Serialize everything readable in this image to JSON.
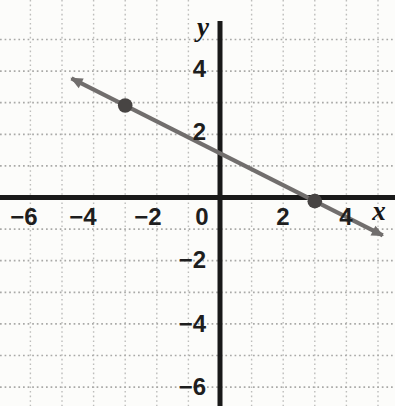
{
  "chart_data": {
    "type": "line",
    "title": "",
    "xlabel": "x",
    "ylabel": "y",
    "xlim": [
      -7,
      5.5
    ],
    "ylim": [
      -6.6,
      6.2
    ],
    "grid": {
      "style": "dotted",
      "spacing": 1,
      "x_range": [
        -6,
        5
      ],
      "y_range": [
        -6,
        5
      ]
    },
    "x_ticks": {
      "values": [
        -6,
        -4,
        -2,
        0,
        2,
        4
      ],
      "labels": [
        "−6",
        "−4",
        "−2",
        "0",
        "2",
        "4"
      ]
    },
    "y_ticks": {
      "values": [
        4,
        2,
        -2,
        -4,
        -6
      ],
      "labels": [
        "4",
        "2",
        "−2",
        "−4",
        "−6"
      ]
    },
    "points": [
      {
        "x": -3,
        "y": 3
      },
      {
        "x": 3,
        "y": 0
      }
    ],
    "line": {
      "slope": -0.5,
      "y_intercept": 1.5,
      "arrows_both_ends": true,
      "extent": [
        [
          -4.7,
          3.77
        ],
        [
          5.15,
          -1.2
        ]
      ]
    },
    "colors": {
      "background": "#fcfcfa",
      "axis": "#191919",
      "grid_horizontal": "#a9a9a7",
      "grid_vertical": "#bdbdbb",
      "line": "#716e6d",
      "point": "#474443",
      "label": "#1e1e1e"
    }
  }
}
